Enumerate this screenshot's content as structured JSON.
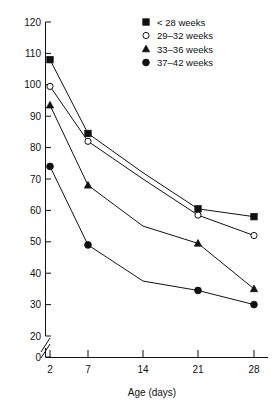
{
  "chart_data": {
    "type": "line",
    "title": "",
    "subtitle": "",
    "xlabel": "Age (days)",
    "ylabel": "",
    "x": [
      2,
      7,
      14,
      21,
      28
    ],
    "xticklabels": [
      "2",
      "7",
      "14",
      "21",
      "28"
    ],
    "yticklabels": [
      "0",
      "20",
      "30",
      "40",
      "50",
      "60",
      "70",
      "80",
      "90",
      "100",
      "110",
      "120"
    ],
    "yticks": [
      0,
      20,
      30,
      40,
      50,
      60,
      70,
      80,
      90,
      100,
      110,
      120
    ],
    "ylim": [
      20,
      120
    ],
    "y_axis_break": true,
    "y_axis_break_note": "axis broken between 0 and 20",
    "grid": false,
    "legend_position": "top-right",
    "series": [
      {
        "name": "< 28 weeks",
        "marker": "filled-square",
        "color": "#111111",
        "values": [
          108,
          84.5,
          72,
          60.5,
          58
        ]
      },
      {
        "name": "29–32 weeks",
        "marker": "open-circle",
        "color": "#111111",
        "values": [
          99.5,
          82,
          70,
          58.5,
          52
        ]
      },
      {
        "name": "33–36 weeks",
        "marker": "filled-triangle",
        "color": "#111111",
        "values": [
          93.5,
          68,
          55,
          49.5,
          35
        ]
      },
      {
        "name": "37–42 weeks",
        "marker": "filled-circle",
        "color": "#111111",
        "values": [
          74,
          49,
          37.5,
          34.5,
          30
        ]
      }
    ]
  },
  "axes": {
    "x_title": "Age (days)",
    "x_ticks": [
      "2",
      "7",
      "14",
      "21",
      "28"
    ],
    "y_ticks": [
      "120",
      "110",
      "100",
      "90",
      "80",
      "70",
      "60",
      "50",
      "40",
      "30",
      "20",
      "0"
    ]
  },
  "legend": {
    "items": [
      {
        "label": "< 28 weeks",
        "marker": "filled-square"
      },
      {
        "label": "29–32 weeks",
        "marker": "open-circle"
      },
      {
        "label": "33–36 weeks",
        "marker": "filled-triangle"
      },
      {
        "label": "37–42 weeks",
        "marker": "filled-circle"
      }
    ]
  }
}
